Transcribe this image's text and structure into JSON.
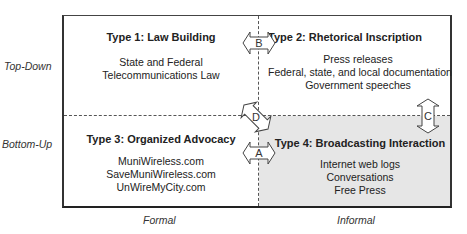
{
  "axes": {
    "rows": [
      "Top-Down",
      "Bottom-Up"
    ],
    "columns": [
      "Formal",
      "Informal"
    ]
  },
  "quadrants": [
    {
      "title": "Type 1:  Law Building",
      "items": [
        "State and Federal",
        "Telecommunications Law"
      ]
    },
    {
      "title": "Type 2:  Rhetorical Inscription",
      "items": [
        "Press releases",
        "Federal, state, and local documentation",
        "Government speeches"
      ]
    },
    {
      "title": "Type 3:  Organized Advocacy",
      "items": [
        "MuniWireless.com",
        "SaveMuniWireless.com",
        "UnWireMyCity.com"
      ]
    },
    {
      "title": "Type 4:  Broadcasting Interaction",
      "items": [
        "Internet web logs",
        "Conversations",
        "Free Press"
      ]
    }
  ],
  "arrows": {
    "A": "A",
    "B": "B",
    "C": "C",
    "D": "D"
  },
  "colors": {
    "shaded_quadrant": "#e6e6e6",
    "lines": "#333333"
  }
}
